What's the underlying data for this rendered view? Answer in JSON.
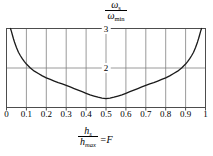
{
  "chart_data": {
    "type": "line",
    "title": "",
    "ylabel_numerator": "ω",
    "ylabel_numerator_sub": "s",
    "ylabel_denominator": "ω",
    "ylabel_denominator_sub": "min",
    "xlabel_numerator": "h",
    "xlabel_numerator_sub": "s",
    "xlabel_denominator": "h",
    "xlabel_denominator_sub": "max",
    "xlabel_suffix": "=F",
    "xlim": [
      0,
      1
    ],
    "ylim": [
      1,
      3
    ],
    "grid": true,
    "legend": "none",
    "xticks": [
      "0",
      "0.1",
      "0.2",
      "0.3",
      "0.4",
      "0.5",
      "0.6",
      "0.7",
      "0.8",
      "0.9",
      "1"
    ],
    "xtick_values": [
      0,
      0.1,
      0.2,
      0.3,
      0.4,
      0.5,
      0.6,
      0.7,
      0.8,
      0.9,
      1
    ],
    "yticks": [
      "2",
      "3"
    ],
    "ytick_values": [
      2,
      3
    ],
    "curve_color": "#1a1a1a",
    "grid_color": "#808080",
    "frame_color": "#4d4d4d",
    "x": [
      0.02,
      0.025,
      0.03,
      0.035,
      0.04,
      0.05,
      0.06,
      0.07,
      0.08,
      0.09,
      0.1,
      0.12,
      0.14,
      0.16,
      0.18,
      0.2,
      0.22,
      0.24,
      0.26,
      0.28,
      0.3,
      0.32,
      0.34,
      0.36,
      0.38,
      0.4,
      0.42,
      0.44,
      0.46,
      0.48,
      0.5,
      0.52,
      0.54,
      0.56,
      0.58,
      0.6,
      0.62,
      0.64,
      0.66,
      0.68,
      0.7,
      0.72,
      0.74,
      0.76,
      0.78,
      0.8,
      0.82,
      0.84,
      0.86,
      0.88,
      0.9,
      0.91,
      0.92,
      0.93,
      0.94,
      0.95,
      0.96,
      0.965,
      0.97,
      0.975,
      0.98
    ],
    "y": [
      3.0,
      2.92,
      2.83,
      2.74,
      2.66,
      2.52,
      2.4,
      2.31,
      2.23,
      2.16,
      2.1,
      2.0,
      1.92,
      1.86,
      1.8,
      1.75,
      1.71,
      1.67,
      1.63,
      1.6,
      1.56,
      1.52,
      1.48,
      1.44,
      1.4,
      1.36,
      1.32,
      1.29,
      1.26,
      1.24,
      1.225,
      1.24,
      1.26,
      1.29,
      1.32,
      1.36,
      1.4,
      1.44,
      1.48,
      1.52,
      1.56,
      1.6,
      1.63,
      1.67,
      1.71,
      1.75,
      1.8,
      1.86,
      1.92,
      2.0,
      2.1,
      2.16,
      2.23,
      2.31,
      2.4,
      2.52,
      2.66,
      2.74,
      2.83,
      2.92,
      3.0
    ]
  }
}
